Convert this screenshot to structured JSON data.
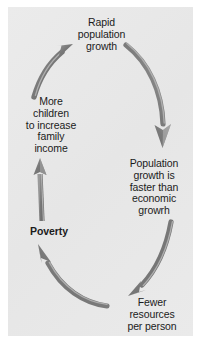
{
  "diagram": {
    "type": "cycle-diagram",
    "direction": "clockwise",
    "panel_color": "#e9e9e9",
    "arrow_color": "#7a7a7a",
    "arrow_highlight_color": "#b4b4b4",
    "text_color": "#1b1b1b",
    "nodes": [
      {
        "id": "rapid-population-growth",
        "label": "Rapid\npopulation\ngrowth",
        "bold": false
      },
      {
        "id": "more-children",
        "label": "More\nchildren\nto increase\nfamily\nincome",
        "bold": false
      },
      {
        "id": "population-growth-faster",
        "label": "Population\ngrowth is\nfaster than\neconomic\ngrowrh",
        "bold": false
      },
      {
        "id": "poverty",
        "label": "Poverty",
        "bold": true
      },
      {
        "id": "fewer-resources",
        "label": "Fewer\nresources\nper person",
        "bold": false
      }
    ],
    "arrows": [
      {
        "id": "more-children-to-rapid-growth",
        "from": "more-children",
        "to": "rapid-population-growth"
      },
      {
        "id": "rapid-growth-to-population-faster",
        "from": "rapid-population-growth",
        "to": "population-growth-faster"
      },
      {
        "id": "population-faster-to-fewer-resources",
        "from": "population-growth-faster",
        "to": "fewer-resources"
      },
      {
        "id": "fewer-resources-to-poverty",
        "from": "fewer-resources",
        "to": "poverty"
      },
      {
        "id": "poverty-to-more-children",
        "from": "poverty",
        "to": "more-children"
      }
    ]
  }
}
